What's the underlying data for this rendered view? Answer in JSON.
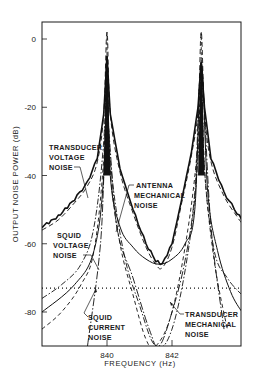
{
  "chart_data": {
    "type": "line",
    "title": "",
    "xlabel": "FREQUENCY (Hz)",
    "ylabel": "OUTPUT NOISE POWER (dB)",
    "xlim": [
      838.0,
      844.15
    ],
    "ylim": [
      -90,
      5
    ],
    "x_ticks": [
      840,
      842
    ],
    "x_tick_labels": [
      "840",
      "842"
    ],
    "y_ticks": [
      0,
      -20,
      -40,
      -60,
      -80
    ],
    "y_tick_labels": [
      "0",
      "-20",
      "-40",
      "-60",
      "-80"
    ],
    "grid": false,
    "resonances_hz": [
      840.0,
      842.9
    ],
    "annotations": [
      {
        "text": [
          "TRANSDUCER",
          "VOLTAGE",
          "NOISE"
        ],
        "target": "transducer_voltage_noise"
      },
      {
        "text": [
          "ANTENNA",
          "MECHANICAL",
          "NOISE"
        ],
        "target": "antenna_mechanical_noise"
      },
      {
        "text": [
          "SQUID",
          "VOLTAGE",
          "NOISE"
        ],
        "target": "squid_voltage_noise"
      },
      {
        "text": [
          "SQUID",
          "CURRENT",
          "NOISE"
        ],
        "target": "squid_current_noise"
      },
      {
        "text": [
          "TRANSDUCER",
          "MECHANICAL",
          "NOISE"
        ],
        "target": "transducer_mechanical_noise"
      }
    ],
    "series": [
      {
        "name": "Total measured output noise",
        "style": "solid-thick-noisy",
        "x": [
          838.0,
          838.5,
          839.0,
          839.4,
          839.7,
          839.9,
          840.0,
          840.1,
          840.4,
          840.8,
          841.2,
          841.5,
          841.7,
          842.0,
          842.3,
          842.6,
          842.8,
          842.9,
          843.0,
          843.2,
          843.6,
          844.0,
          844.15
        ],
        "y": [
          -55,
          -52,
          -47,
          -42,
          -35,
          -22,
          -5,
          -22,
          -38,
          -50,
          -60,
          -65,
          -66,
          -60,
          -47,
          -33,
          -20,
          -7,
          -20,
          -35,
          -45,
          -51,
          -53
        ]
      },
      {
        "name": "Transducer voltage noise",
        "style": "dashed-long",
        "x": [
          838.0,
          838.5,
          839.0,
          839.4,
          839.7,
          839.9,
          840.0,
          840.1,
          840.4,
          840.8,
          841.2,
          841.5,
          841.7,
          842.0,
          842.3,
          842.6,
          842.8,
          842.9,
          843.0,
          843.2,
          843.6,
          844.0,
          844.15
        ],
        "y": [
          -56,
          -53,
          -48,
          -43,
          -36,
          -22,
          2,
          -22,
          -39,
          -51,
          -61,
          -66,
          -67,
          -61,
          -48,
          -34,
          -21,
          2,
          -21,
          -36,
          -46,
          -52,
          -54
        ]
      },
      {
        "name": "Antenna mechanical noise",
        "style": "solid-thin",
        "x": [
          838.0,
          839.0,
          839.6,
          839.9,
          840.0,
          840.1,
          840.4,
          840.8,
          841.2,
          841.6,
          842.0,
          842.4,
          842.7,
          842.9,
          843.1,
          843.4,
          843.8,
          844.15
        ],
        "y": [
          -80,
          -72,
          -62,
          -40,
          -5,
          -40,
          -55,
          -61,
          -64.5,
          -66,
          -64.5,
          -60,
          -50,
          -7,
          -45,
          -62,
          -74,
          -80
        ]
      },
      {
        "name": "SQUID voltage noise",
        "style": "dash-dot",
        "x": [
          838.0,
          838.6,
          839.2,
          839.6,
          839.9,
          840.0,
          840.1,
          840.5,
          841.0,
          841.5,
          842.0,
          842.5,
          842.8,
          842.9,
          843.0,
          843.3,
          843.7,
          844.15
        ],
        "y": [
          -76,
          -72,
          -66,
          -55,
          -30,
          -5,
          -35,
          -62,
          -78,
          -90,
          -85,
          -62,
          -35,
          -7,
          -38,
          -62,
          -70,
          -75
        ]
      },
      {
        "name": "SQUID current noise",
        "style": "dashed-medium",
        "x": [
          838.0,
          838.6,
          839.2,
          839.6,
          839.9,
          840.0,
          840.1,
          840.4,
          840.8,
          841.2,
          841.5,
          842.0,
          842.5,
          842.8,
          842.9,
          843.0,
          843.3,
          843.7
        ],
        "y": [
          -85,
          -80,
          -72,
          -62,
          -35,
          -5,
          -38,
          -60,
          -75,
          -88,
          -90,
          -80,
          -55,
          -30,
          -7,
          -38,
          -65,
          -85
        ]
      },
      {
        "name": "Transducer mechanical noise",
        "style": "dash-dot-long",
        "x": [
          839.4,
          839.8,
          840.0,
          840.3,
          840.8,
          841.3,
          841.6,
          842.0,
          842.4,
          842.7,
          842.9,
          843.2,
          843.6
        ],
        "y": [
          -90,
          -60,
          -25,
          -55,
          -70,
          -85,
          -90,
          -80,
          -65,
          -45,
          -10,
          -55,
          -85
        ]
      },
      {
        "name": "Reference level (dotted)",
        "style": "dotted",
        "x": [
          838.0,
          844.15
        ],
        "y": [
          -73,
          -73
        ]
      }
    ]
  }
}
